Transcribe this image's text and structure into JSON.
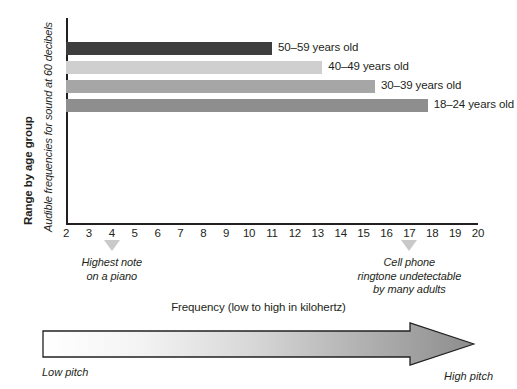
{
  "chart_data": {
    "type": "bar",
    "title": "",
    "orientation": "horizontal",
    "ylabel_bold": "Range by age group",
    "ylabel_italic": "Audible frequencies for sound at 60 decibels",
    "xlabel": "Frequency (low to high in kilohertz)",
    "xlim": [
      2,
      20
    ],
    "xunit": "kHz",
    "grid": false,
    "legend": "inline-right-of-bar",
    "categories": [
      "50–59 years old",
      "40–49 years old",
      "30–39 years old",
      "18–24 years old"
    ],
    "values": [
      11.0,
      13.2,
      15.5,
      17.8
    ],
    "bar_start": 2,
    "bars": [
      {
        "label": "50–59 years old",
        "start": 2,
        "end": 11.0,
        "color": "#3d3d3d"
      },
      {
        "label": "40–49 years old",
        "start": 2,
        "end": 13.2,
        "color": "#cfcfcf"
      },
      {
        "label": "30–39 years old",
        "start": 2,
        "end": 15.5,
        "color": "#a6a6a6"
      },
      {
        "label": "18–24 years old",
        "start": 2,
        "end": 17.8,
        "color": "#8e8e8e"
      }
    ],
    "tick_labels": [
      "2",
      "3",
      "4",
      "5",
      "6",
      "7",
      "8",
      "9",
      "10",
      "11",
      "12",
      "13",
      "14",
      "15",
      "16",
      "17",
      "18",
      "19",
      "20"
    ],
    "annotations": [
      {
        "at": 4,
        "lines": [
          "Highest note",
          "on a piano"
        ]
      },
      {
        "at": 17,
        "lines": [
          "Cell phone",
          "ringtone undetectable",
          "by many adults"
        ]
      }
    ]
  },
  "scale_bar": {
    "caption": "Frequency (low to high in kilohertz)",
    "low_label": "Low pitch",
    "high_label": "High pitch",
    "gradient_from": "#ffffff",
    "gradient_to": "#8e8e8e"
  },
  "colors": {
    "axis": "#231f20",
    "marker": "#c9c9c9",
    "text": "#231f20"
  }
}
